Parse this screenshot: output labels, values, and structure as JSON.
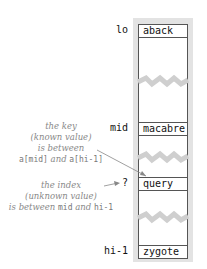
{
  "diagram": {
    "cells": [
      {
        "index_label": "lo",
        "value": "aback"
      },
      {
        "index_label": "mid",
        "value": "macabre"
      },
      {
        "index_label": "?",
        "value": "query"
      },
      {
        "index_label": "hi-1",
        "value": "zygote"
      }
    ],
    "note_key": {
      "line1": "the key",
      "line2": "(known value)",
      "line3": "is between",
      "code1": "a[mid]",
      "and": "and",
      "code2": "a[hi-1]"
    },
    "note_index": {
      "line1": "the index",
      "line2": "(unknown value)",
      "prefix": "is between",
      "code1": "mid",
      "and": "and",
      "code2": "hi-1"
    },
    "colors": {
      "column": "#e3e3e3",
      "zigzag": "#cfcfcf",
      "arrow": "#888888",
      "border": "#555555"
    }
  }
}
